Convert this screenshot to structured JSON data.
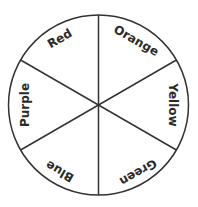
{
  "diagram": {
    "type": "color-wheel",
    "segments": [
      {
        "label": "Red"
      },
      {
        "label": "Orange"
      },
      {
        "label": "Yellow"
      },
      {
        "label": "Green"
      },
      {
        "label": "Blue"
      },
      {
        "label": "Purple"
      }
    ],
    "stroke_color": "#333333",
    "background": "#ffffff"
  }
}
